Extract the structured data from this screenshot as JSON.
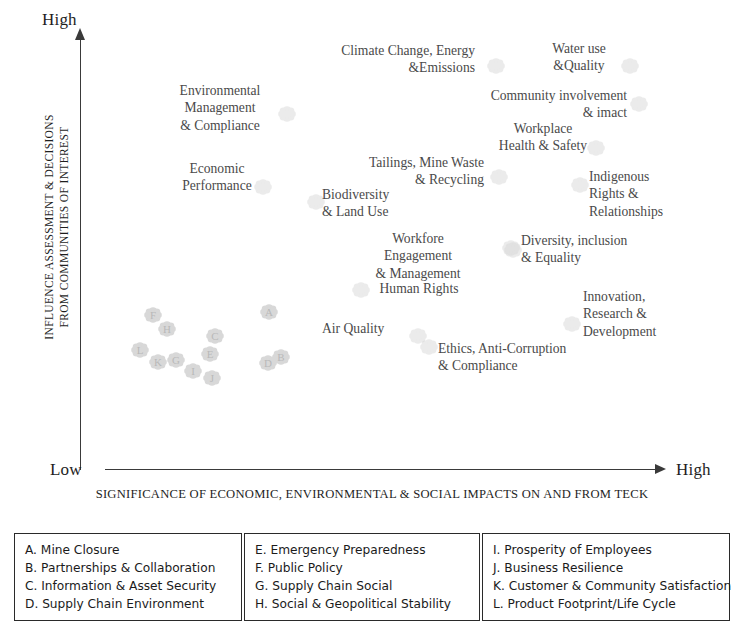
{
  "axes": {
    "y_top_label": "High",
    "x_left_label": "Low",
    "x_right_label": "High",
    "y_title_line1": "INFLUENCE ASSESSMENT & DECISIONS",
    "y_title_line2": "FROM COMMUNITIES OF INTEREST",
    "x_title": "SIGNIFICANCE OF ECONOMIC, ENVIRONMENTAL & SOCIAL IMPACTS ON AND FROM TECK"
  },
  "chart_data": {
    "type": "scatter",
    "title": "",
    "xlabel": "SIGNIFICANCE OF ECONOMIC, ENVIRONMENTAL & SOCIAL IMPACTS ON AND FROM TECK",
    "ylabel": "INFLUENCE ASSESSMENT & DECISIONS FROM COMMUNITIES OF INTEREST",
    "xlim": [
      0,
      100
    ],
    "ylim": [
      0,
      100
    ],
    "x_ticks": [
      "Low",
      "High"
    ],
    "y_ticks": [
      "",
      "High"
    ],
    "grid": false,
    "legend_position": "bottom",
    "marker_style": "faint-floral",
    "points": [
      {
        "label": "Climate Change, Energy\n&Emissions",
        "x": 75,
        "y": 96,
        "marker_x": 486,
        "marker_y": 57,
        "align": "right"
      },
      {
        "label": "Water use\n&Quality",
        "x": 92,
        "y": 97,
        "marker_x": 620,
        "marker_y": 57,
        "align": "center"
      },
      {
        "label": "Community involvement\n& imact",
        "x": 90,
        "y": 88,
        "marker_x": 629,
        "marker_y": 95,
        "align": "right"
      },
      {
        "label": "Workplace\nHealth & Safety",
        "x": 84,
        "y": 80,
        "marker_x": 586,
        "marker_y": 139,
        "align": "center"
      },
      {
        "label": "Environmental\nManagement\n& Compliance",
        "x": 30,
        "y": 89,
        "marker_x": 277,
        "marker_y": 105,
        "align": "center"
      },
      {
        "label": "Economic\nPerformance",
        "x": 30,
        "y": 72,
        "marker_x": 253,
        "marker_y": 178,
        "align": "center"
      },
      {
        "label": "Tailings, Mine Waste\n& Recycling",
        "x": 66,
        "y": 70,
        "marker_x": 489,
        "marker_y": 168,
        "align": "right"
      },
      {
        "label": "Biodiversity\n& Land Use",
        "x": 58,
        "y": 64,
        "marker_x": 306,
        "marker_y": 193,
        "align": "left"
      },
      {
        "label": "Indigenous\nRights &\nRelationships",
        "x": 95,
        "y": 64,
        "marker_x": 570,
        "marker_y": 176,
        "align": "left"
      },
      {
        "label": "Workfore\nEngagement\n& Management",
        "x": 62,
        "y": 54,
        "marker_x": 501,
        "marker_y": 239,
        "align": "center"
      },
      {
        "label": "Diversity, inclusion\n& Equality",
        "x": 86,
        "y": 52,
        "marker_x": 503,
        "marker_y": 241,
        "align": "left"
      },
      {
        "label": "Human Rights",
        "x": 61,
        "y": 46,
        "marker_x": 351,
        "marker_y": 281,
        "align": "center"
      },
      {
        "label": "Innovation,\nResearch &\nDevelopment",
        "x": 93,
        "y": 40,
        "marker_x": 562,
        "marker_y": 315,
        "align": "left"
      },
      {
        "label": "Air Quality",
        "x": 56,
        "y": 33,
        "marker_x": 408,
        "marker_y": 327,
        "align": "left"
      },
      {
        "label": "Ethics, Anti-Corruption\n& Compliance",
        "x": 78,
        "y": 30,
        "marker_x": 419,
        "marker_y": 338,
        "align": "left"
      }
    ],
    "lettered_points": [
      {
        "letter": "F",
        "x": 10,
        "y": 28,
        "marker_x": 143,
        "marker_y": 306
      },
      {
        "letter": "H",
        "x": 13,
        "y": 25,
        "marker_x": 157,
        "marker_y": 320
      },
      {
        "letter": "A",
        "x": 35,
        "y": 29,
        "marker_x": 259,
        "marker_y": 303
      },
      {
        "letter": "C",
        "x": 21,
        "y": 23,
        "marker_x": 205,
        "marker_y": 327
      },
      {
        "letter": "L",
        "x": 7,
        "y": 20,
        "marker_x": 130,
        "marker_y": 341
      },
      {
        "letter": "E",
        "x": 20,
        "y": 19,
        "marker_x": 200,
        "marker_y": 345
      },
      {
        "letter": "K",
        "x": 11,
        "y": 17,
        "marker_x": 148,
        "marker_y": 353
      },
      {
        "letter": "G",
        "x": 14,
        "y": 17,
        "marker_x": 166,
        "marker_y": 351
      },
      {
        "letter": "I",
        "x": 17,
        "y": 15,
        "marker_x": 183,
        "marker_y": 362
      },
      {
        "letter": "J",
        "x": 21,
        "y": 13,
        "marker_x": 202,
        "marker_y": 369
      },
      {
        "letter": "D",
        "x": 33,
        "y": 17,
        "marker_x": 258,
        "marker_y": 354
      },
      {
        "letter": "B",
        "x": 36,
        "y": 18,
        "marker_x": 271,
        "marker_y": 348
      }
    ]
  },
  "legend": {
    "columns": [
      {
        "items": [
          "A. Mine Closure",
          "B. Partnerships & Collaboration",
          "C. Information & Asset Security",
          "D. Supply Chain Environment"
        ]
      },
      {
        "items": [
          "E. Emergency Preparedness",
          "F. Public Policy",
          "G. Supply Chain Social",
          "H.  Social & Geopolitical Stability"
        ]
      },
      {
        "items": [
          " I. Prosperity of Employees",
          "J. Business Resilience",
          "K. Customer & Community Satisfaction",
          "L. Product Footprint/Life Cycle"
        ]
      }
    ]
  },
  "colors": {
    "axis": "#3a3a3a",
    "text": "#1e1e1e",
    "label_text": "#4a4a4a",
    "marker": "#d8d8d8",
    "legend_border": "#2a2a2a",
    "background": "#ffffff"
  }
}
